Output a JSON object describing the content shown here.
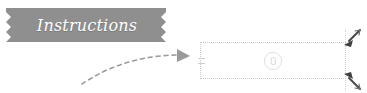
{
  "canvas": {
    "width": 367,
    "height": 93,
    "background": "#ffffff"
  },
  "banner": {
    "label": "Instructions",
    "fill_color": "#8f8f8f",
    "text_color": "#ffffff",
    "shape": "notched-ribbon",
    "left_notch": "zigzag",
    "right_notch": "zigzag"
  },
  "arrow": {
    "name": "curved-dashed-arrow",
    "style": "dashed",
    "direction": "left-to-right-curve-up",
    "color": "#9a9a9a",
    "head": "filled-triangle"
  },
  "placeholder": {
    "name": "dotted-content-box",
    "border_style": "dotted",
    "border_color": "#c9c9c9",
    "fill_color": "#ffffff",
    "icon": "circle-icon",
    "icon_color": "#dedede",
    "left_ticks": 2
  },
  "handles": [
    {
      "name": "resize-handle-top-right",
      "direction": "down-left",
      "color": "#555555"
    },
    {
      "name": "resize-handle-bottom-right",
      "direction": "up-left",
      "color": "#555555"
    }
  ]
}
